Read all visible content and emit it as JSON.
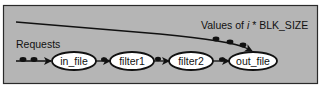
{
  "diagram": {
    "type": "pipeline",
    "colors": {
      "frame_fill": "#b5b5b5",
      "frame_border": "#2a2a2a",
      "node_fill": "#ffffff",
      "stroke": "#111111"
    },
    "labels": {
      "requests": "Requests",
      "values_prefix": "Values of ",
      "values_var": "i",
      "values_suffix": " * BLK_SIZE"
    },
    "nodes": [
      {
        "id": "in_file",
        "label": "in_file"
      },
      {
        "id": "filter1",
        "label": "filter1"
      },
      {
        "id": "filter2",
        "label": "filter2"
      },
      {
        "id": "out_file",
        "label": "out_file"
      }
    ],
    "edges": [
      {
        "from": "Requests",
        "to": "in_file"
      },
      {
        "from": "in_file",
        "to": "filter1"
      },
      {
        "from": "filter1",
        "to": "filter2"
      },
      {
        "from": "filter2",
        "to": "out_file"
      },
      {
        "from": "Values of i * BLK_SIZE",
        "to": "out_file"
      }
    ]
  }
}
